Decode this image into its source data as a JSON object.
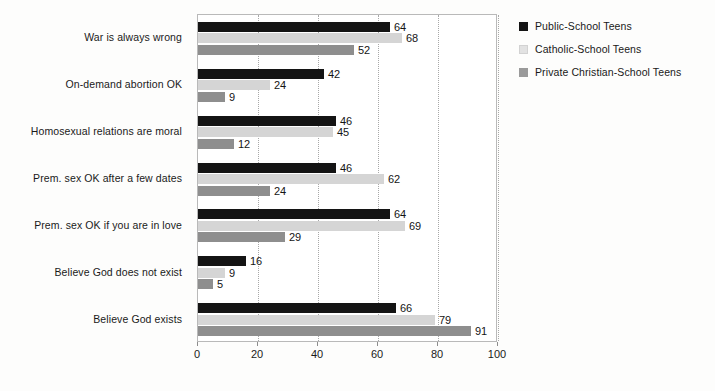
{
  "chart_data": {
    "type": "bar",
    "orientation": "horizontal",
    "title": "",
    "subtitle": "",
    "xlabel": "",
    "ylabel": "",
    "xlim": [
      0,
      100
    ],
    "xticks": [
      0,
      20,
      40,
      60,
      80,
      100
    ],
    "xticklabels": [
      "0",
      "20",
      "40",
      "60",
      "80",
      "100"
    ],
    "grid": true,
    "grid_axis": "x",
    "grid_style": "dotted",
    "legend_position": "top-right",
    "categories": [
      "War is always wrong",
      "On-demand abortion OK",
      "Homosexual relations are moral",
      "Prem. sex OK after a few dates",
      "Prem. sex OK if you are in love",
      "Believe God does not exist",
      "Believe God exists"
    ],
    "series": [
      {
        "name": "Public-School Teens",
        "color": "#141414",
        "values": [
          64,
          42,
          46,
          46,
          64,
          16,
          66
        ]
      },
      {
        "name": "Catholic-School Teens",
        "color": "#d5d5d5",
        "values": [
          68,
          24,
          45,
          62,
          69,
          9,
          79
        ]
      },
      {
        "name": "Private Christian-School Teens",
        "color": "#8e8e8e",
        "values": [
          52,
          9,
          12,
          24,
          29,
          5,
          91
        ]
      }
    ]
  },
  "legend": {
    "items": [
      {
        "label": "Public-School Teens"
      },
      {
        "label": "Catholic-School Teens"
      },
      {
        "label": "Private Christian-School Teens"
      }
    ]
  },
  "caption": {
    "text": ""
  }
}
